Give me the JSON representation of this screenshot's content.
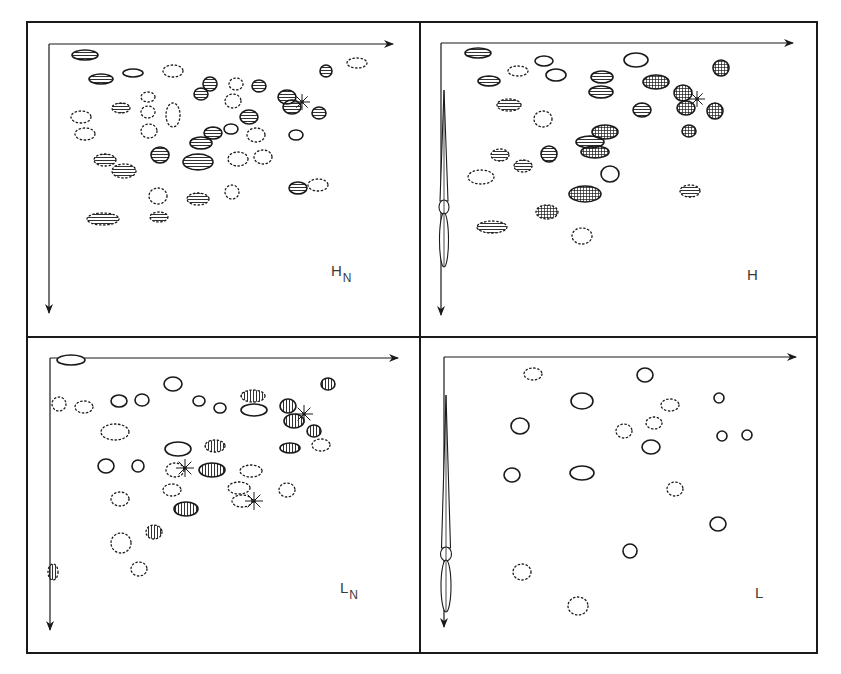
{
  "figure": {
    "colors": {
      "ink": "#1a1a1a",
      "background": "#ffffff",
      "label": "#3a3a3a"
    },
    "legend_styles": {
      "solid": "solid outline, empty",
      "dotted": "dotted outline, empty",
      "hstripe": "solid outline, horizontal hatching",
      "hstripe-dotted": "dotted outline, horizontal hatching",
      "grid": "solid outline, cross-hatched",
      "grid-dotted": "dotted outline, cross-hatched",
      "vstripe": "solid outline, vertical hatching",
      "vstripe-dotted": "dotted outline, vertical hatching",
      "star": "asterisk marker"
    },
    "panels": [
      {
        "id": "HN",
        "label_main": "H",
        "label_sub": "N",
        "has_streak": false,
        "spots": [
          {
            "x": 85,
            "y": 55,
            "rx": 13,
            "ry": 5,
            "style": "hstripe"
          },
          {
            "x": 101,
            "y": 79,
            "rx": 12,
            "ry": 5,
            "style": "hstripe"
          },
          {
            "x": 133,
            "y": 73,
            "rx": 10,
            "ry": 4,
            "style": "solid"
          },
          {
            "x": 173,
            "y": 71,
            "rx": 10,
            "ry": 6,
            "style": "dotted"
          },
          {
            "x": 210,
            "y": 84,
            "rx": 7,
            "ry": 7,
            "style": "hstripe"
          },
          {
            "x": 236,
            "y": 84,
            "rx": 7,
            "ry": 6,
            "style": "dotted"
          },
          {
            "x": 259,
            "y": 86,
            "rx": 7,
            "ry": 6,
            "style": "hstripe"
          },
          {
            "x": 201,
            "y": 94,
            "rx": 7,
            "ry": 6,
            "style": "hstripe"
          },
          {
            "x": 148,
            "y": 97,
            "rx": 7,
            "ry": 5,
            "style": "dotted"
          },
          {
            "x": 233,
            "y": 101,
            "rx": 8,
            "ry": 7,
            "style": "dotted"
          },
          {
            "x": 287,
            "y": 97,
            "rx": 9,
            "ry": 7,
            "style": "hstripe"
          },
          {
            "x": 292,
            "y": 107,
            "rx": 9,
            "ry": 7,
            "style": "hstripe"
          },
          {
            "x": 326,
            "y": 71,
            "rx": 6,
            "ry": 6,
            "style": "hstripe"
          },
          {
            "x": 357,
            "y": 63,
            "rx": 10,
            "ry": 5,
            "style": "dotted"
          },
          {
            "x": 319,
            "y": 113,
            "rx": 7,
            "ry": 6,
            "style": "hstripe"
          },
          {
            "x": 121,
            "y": 108,
            "rx": 9,
            "ry": 5,
            "style": "hstripe-dotted"
          },
          {
            "x": 148,
            "y": 112,
            "rx": 7,
            "ry": 6,
            "style": "dotted"
          },
          {
            "x": 173,
            "y": 115,
            "rx": 7,
            "ry": 12,
            "style": "dotted"
          },
          {
            "x": 81,
            "y": 117,
            "rx": 10,
            "ry": 6,
            "style": "dotted"
          },
          {
            "x": 85,
            "y": 134,
            "rx": 10,
            "ry": 6,
            "style": "dotted"
          },
          {
            "x": 149,
            "y": 131,
            "rx": 8,
            "ry": 7,
            "style": "dotted"
          },
          {
            "x": 249,
            "y": 117,
            "rx": 9,
            "ry": 7,
            "style": "hstripe"
          },
          {
            "x": 213,
            "y": 133,
            "rx": 9,
            "ry": 6,
            "style": "hstripe"
          },
          {
            "x": 231,
            "y": 129,
            "rx": 7,
            "ry": 5,
            "style": "solid"
          },
          {
            "x": 256,
            "y": 135,
            "rx": 9,
            "ry": 7,
            "style": "dotted"
          },
          {
            "x": 296,
            "y": 135,
            "rx": 7,
            "ry": 5,
            "style": "solid"
          },
          {
            "x": 201,
            "y": 143,
            "rx": 11,
            "ry": 6,
            "style": "hstripe"
          },
          {
            "x": 105,
            "y": 160,
            "rx": 11,
            "ry": 6,
            "style": "hstripe-dotted"
          },
          {
            "x": 124,
            "y": 171,
            "rx": 12,
            "ry": 7,
            "style": "hstripe-dotted"
          },
          {
            "x": 160,
            "y": 155,
            "rx": 9,
            "ry": 8,
            "style": "hstripe"
          },
          {
            "x": 198,
            "y": 162,
            "rx": 15,
            "ry": 8,
            "style": "hstripe"
          },
          {
            "x": 238,
            "y": 159,
            "rx": 10,
            "ry": 7,
            "style": "dotted"
          },
          {
            "x": 263,
            "y": 157,
            "rx": 9,
            "ry": 7,
            "style": "dotted"
          },
          {
            "x": 298,
            "y": 188,
            "rx": 9,
            "ry": 6,
            "style": "hstripe"
          },
          {
            "x": 318,
            "y": 185,
            "rx": 10,
            "ry": 6,
            "style": "dotted"
          },
          {
            "x": 158,
            "y": 196,
            "rx": 9,
            "ry": 8,
            "style": "dotted"
          },
          {
            "x": 198,
            "y": 199,
            "rx": 11,
            "ry": 6,
            "style": "hstripe-dotted"
          },
          {
            "x": 232,
            "y": 192,
            "rx": 7,
            "ry": 7,
            "style": "dotted"
          },
          {
            "x": 103,
            "y": 219,
            "rx": 16,
            "ry": 6,
            "style": "hstripe-dotted"
          },
          {
            "x": 159,
            "y": 217,
            "rx": 9,
            "ry": 5,
            "style": "hstripe-dotted"
          },
          {
            "x": 302,
            "y": 102,
            "rx": 8,
            "ry": 8,
            "style": "star"
          }
        ]
      },
      {
        "id": "H",
        "label_main": "H",
        "label_sub": "",
        "has_streak": true,
        "spots": [
          {
            "x": 478,
            "y": 53,
            "rx": 13,
            "ry": 5,
            "style": "hstripe"
          },
          {
            "x": 544,
            "y": 61,
            "rx": 9,
            "ry": 5,
            "style": "solid"
          },
          {
            "x": 518,
            "y": 71,
            "rx": 10,
            "ry": 5,
            "style": "dotted"
          },
          {
            "x": 556,
            "y": 75,
            "rx": 10,
            "ry": 6,
            "style": "solid"
          },
          {
            "x": 489,
            "y": 81,
            "rx": 11,
            "ry": 5,
            "style": "hstripe"
          },
          {
            "x": 636,
            "y": 60,
            "rx": 12,
            "ry": 7,
            "style": "solid"
          },
          {
            "x": 602,
            "y": 77,
            "rx": 11,
            "ry": 6,
            "style": "hstripe"
          },
          {
            "x": 601,
            "y": 92,
            "rx": 12,
            "ry": 6,
            "style": "hstripe"
          },
          {
            "x": 656,
            "y": 82,
            "rx": 13,
            "ry": 7,
            "style": "grid"
          },
          {
            "x": 721,
            "y": 68,
            "rx": 8,
            "ry": 8,
            "style": "grid"
          },
          {
            "x": 683,
            "y": 93,
            "rx": 9,
            "ry": 8,
            "style": "grid"
          },
          {
            "x": 686,
            "y": 108,
            "rx": 9,
            "ry": 7,
            "style": "grid"
          },
          {
            "x": 715,
            "y": 111,
            "rx": 8,
            "ry": 8,
            "style": "grid"
          },
          {
            "x": 509,
            "y": 105,
            "rx": 12,
            "ry": 6,
            "style": "hstripe-dotted"
          },
          {
            "x": 543,
            "y": 119,
            "rx": 9,
            "ry": 8,
            "style": "dotted"
          },
          {
            "x": 642,
            "y": 110,
            "rx": 9,
            "ry": 7,
            "style": "hstripe"
          },
          {
            "x": 689,
            "y": 131,
            "rx": 7,
            "ry": 6,
            "style": "grid"
          },
          {
            "x": 605,
            "y": 132,
            "rx": 13,
            "ry": 7,
            "style": "grid"
          },
          {
            "x": 590,
            "y": 142,
            "rx": 14,
            "ry": 6,
            "style": "hstripe"
          },
          {
            "x": 595,
            "y": 152,
            "rx": 14,
            "ry": 6,
            "style": "grid"
          },
          {
            "x": 500,
            "y": 155,
            "rx": 9,
            "ry": 6,
            "style": "hstripe-dotted"
          },
          {
            "x": 523,
            "y": 166,
            "rx": 9,
            "ry": 6,
            "style": "hstripe-dotted"
          },
          {
            "x": 549,
            "y": 154,
            "rx": 8,
            "ry": 8,
            "style": "hstripe"
          },
          {
            "x": 481,
            "y": 177,
            "rx": 13,
            "ry": 7,
            "style": "dotted"
          },
          {
            "x": 610,
            "y": 174,
            "rx": 9,
            "ry": 8,
            "style": "solid"
          },
          {
            "x": 585,
            "y": 194,
            "rx": 16,
            "ry": 8,
            "style": "grid"
          },
          {
            "x": 690,
            "y": 191,
            "rx": 10,
            "ry": 6,
            "style": "hstripe-dotted"
          },
          {
            "x": 547,
            "y": 212,
            "rx": 11,
            "ry": 7,
            "style": "grid-dotted"
          },
          {
            "x": 492,
            "y": 227,
            "rx": 15,
            "ry": 6,
            "style": "hstripe-dotted"
          },
          {
            "x": 582,
            "y": 236,
            "rx": 10,
            "ry": 8,
            "style": "dotted"
          },
          {
            "x": 697,
            "y": 99,
            "rx": 8,
            "ry": 8,
            "style": "star"
          }
        ],
        "streak": {
          "x": 444,
          "y_top": 110,
          "y_bottom": 267,
          "width": 8,
          "knot_y": 207
        }
      },
      {
        "id": "LN",
        "label_main": "L",
        "label_sub": "N",
        "has_streak": false,
        "spots": [
          {
            "x": 71,
            "y": 360,
            "rx": 14,
            "ry": 5,
            "style": "solid"
          },
          {
            "x": 173,
            "y": 384,
            "rx": 9,
            "ry": 7,
            "style": "solid"
          },
          {
            "x": 59,
            "y": 404,
            "rx": 7,
            "ry": 7,
            "style": "dotted"
          },
          {
            "x": 84,
            "y": 407,
            "rx": 9,
            "ry": 6,
            "style": "dotted"
          },
          {
            "x": 119,
            "y": 401,
            "rx": 8,
            "ry": 6,
            "style": "solid"
          },
          {
            "x": 142,
            "y": 400,
            "rx": 7,
            "ry": 6,
            "style": "solid"
          },
          {
            "x": 199,
            "y": 401,
            "rx": 6,
            "ry": 5,
            "style": "solid"
          },
          {
            "x": 220,
            "y": 408,
            "rx": 6,
            "ry": 5,
            "style": "solid"
          },
          {
            "x": 253,
            "y": 396,
            "rx": 12,
            "ry": 6,
            "style": "vstripe-dotted"
          },
          {
            "x": 254,
            "y": 410,
            "rx": 13,
            "ry": 6,
            "style": "solid"
          },
          {
            "x": 288,
            "y": 406,
            "rx": 8,
            "ry": 7,
            "style": "vstripe"
          },
          {
            "x": 328,
            "y": 384,
            "rx": 7,
            "ry": 6,
            "style": "vstripe"
          },
          {
            "x": 294,
            "y": 421,
            "rx": 10,
            "ry": 7,
            "style": "vstripe"
          },
          {
            "x": 314,
            "y": 431,
            "rx": 7,
            "ry": 6,
            "style": "vstripe"
          },
          {
            "x": 115,
            "y": 432,
            "rx": 14,
            "ry": 8,
            "style": "dotted"
          },
          {
            "x": 178,
            "y": 449,
            "rx": 13,
            "ry": 7,
            "style": "solid"
          },
          {
            "x": 215,
            "y": 446,
            "rx": 10,
            "ry": 6,
            "style": "vstripe-dotted"
          },
          {
            "x": 290,
            "y": 448,
            "rx": 10,
            "ry": 5,
            "style": "vstripe"
          },
          {
            "x": 321,
            "y": 445,
            "rx": 9,
            "ry": 6,
            "style": "dotted"
          },
          {
            "x": 106,
            "y": 466,
            "rx": 8,
            "ry": 7,
            "style": "solid"
          },
          {
            "x": 138,
            "y": 466,
            "rx": 6,
            "ry": 6,
            "style": "solid"
          },
          {
            "x": 175,
            "y": 470,
            "rx": 9,
            "ry": 7,
            "style": "dotted"
          },
          {
            "x": 212,
            "y": 470,
            "rx": 13,
            "ry": 7,
            "style": "vstripe"
          },
          {
            "x": 251,
            "y": 471,
            "rx": 11,
            "ry": 6,
            "style": "dotted"
          },
          {
            "x": 172,
            "y": 490,
            "rx": 9,
            "ry": 6,
            "style": "dotted"
          },
          {
            "x": 239,
            "y": 488,
            "rx": 11,
            "ry": 6,
            "style": "dotted"
          },
          {
            "x": 242,
            "y": 501,
            "rx": 10,
            "ry": 6,
            "style": "dotted"
          },
          {
            "x": 287,
            "y": 490,
            "rx": 8,
            "ry": 7,
            "style": "dotted"
          },
          {
            "x": 120,
            "y": 499,
            "rx": 9,
            "ry": 7,
            "style": "dotted"
          },
          {
            "x": 186,
            "y": 509,
            "rx": 12,
            "ry": 7,
            "style": "vstripe"
          },
          {
            "x": 154,
            "y": 532,
            "rx": 8,
            "ry": 7,
            "style": "vstripe-dotted"
          },
          {
            "x": 121,
            "y": 543,
            "rx": 10,
            "ry": 10,
            "style": "dotted"
          },
          {
            "x": 139,
            "y": 569,
            "rx": 8,
            "ry": 7,
            "style": "dotted"
          },
          {
            "x": 53,
            "y": 572,
            "rx": 5,
            "ry": 8,
            "style": "vstripe-dotted"
          },
          {
            "x": 304,
            "y": 414,
            "rx": 9,
            "ry": 9,
            "style": "star"
          },
          {
            "x": 185,
            "y": 468,
            "rx": 9,
            "ry": 9,
            "style": "star"
          },
          {
            "x": 254,
            "y": 501,
            "rx": 9,
            "ry": 9,
            "style": "star"
          }
        ]
      },
      {
        "id": "L",
        "label_main": "L",
        "label_sub": "",
        "has_streak": true,
        "spots": [
          {
            "x": 533,
            "y": 374,
            "rx": 9,
            "ry": 6,
            "style": "dotted"
          },
          {
            "x": 645,
            "y": 375,
            "rx": 8,
            "ry": 7,
            "style": "solid"
          },
          {
            "x": 582,
            "y": 401,
            "rx": 11,
            "ry": 8,
            "style": "solid"
          },
          {
            "x": 719,
            "y": 398,
            "rx": 5,
            "ry": 5,
            "style": "solid"
          },
          {
            "x": 670,
            "y": 405,
            "rx": 9,
            "ry": 6,
            "style": "dotted"
          },
          {
            "x": 654,
            "y": 423,
            "rx": 8,
            "ry": 6,
            "style": "dotted"
          },
          {
            "x": 520,
            "y": 426,
            "rx": 9,
            "ry": 8,
            "style": "solid"
          },
          {
            "x": 624,
            "y": 431,
            "rx": 8,
            "ry": 7,
            "style": "dotted"
          },
          {
            "x": 722,
            "y": 436,
            "rx": 5,
            "ry": 5,
            "style": "solid"
          },
          {
            "x": 747,
            "y": 435,
            "rx": 5,
            "ry": 5,
            "style": "solid"
          },
          {
            "x": 651,
            "y": 447,
            "rx": 9,
            "ry": 7,
            "style": "solid"
          },
          {
            "x": 512,
            "y": 475,
            "rx": 8,
            "ry": 7,
            "style": "solid"
          },
          {
            "x": 582,
            "y": 473,
            "rx": 12,
            "ry": 7,
            "style": "solid"
          },
          {
            "x": 675,
            "y": 489,
            "rx": 8,
            "ry": 7,
            "style": "dotted"
          },
          {
            "x": 718,
            "y": 524,
            "rx": 8,
            "ry": 7,
            "style": "solid"
          },
          {
            "x": 630,
            "y": 551,
            "rx": 7,
            "ry": 7,
            "style": "solid"
          },
          {
            "x": 522,
            "y": 572,
            "rx": 9,
            "ry": 8,
            "style": "dotted"
          },
          {
            "x": 578,
            "y": 606,
            "rx": 10,
            "ry": 9,
            "style": "dotted"
          }
        ],
        "streak": {
          "x": 446,
          "y_top": 415,
          "y_bottom": 612,
          "width": 9,
          "knot_y": 554
        }
      }
    ]
  }
}
